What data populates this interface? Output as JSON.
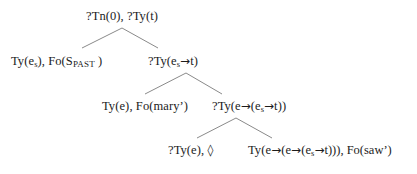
{
  "diagram": {
    "type": "semantic-tree",
    "background_color": "#ffffff",
    "text_color": "#1c1c1c",
    "edge_color": "#8a8a8a",
    "nodes": {
      "root": {
        "label": "?Tn(0), ?Ty(t)",
        "parts": {
          "a": "?Tn(0), ?Ty(",
          "b": "t)"
        }
      },
      "tense": {
        "prefix": "Ty(e",
        "sub1": "s",
        "mid": "), Fo(S",
        "smallcaps": "PAST",
        "suffix": " )"
      },
      "es_to_t": {
        "prefix": "?Ty(e",
        "sub1": "s",
        "arrow": "→",
        "suffix": "t)"
      },
      "mary": {
        "label": "Ty(e), Fo(mary’)"
      },
      "e_to_es_t": {
        "prefix": "?Ty(e",
        "arrow1": "→",
        "mid": "(e",
        "sub1": "s",
        "arrow2": "→",
        "suffix": "t))"
      },
      "pointer": {
        "prefix": "?Ty(e), ",
        "pointer_symbol": "◊"
      },
      "saw": {
        "prefix": "Ty(e",
        "arrow1": "→",
        "mid1": "(e",
        "arrow2": "→",
        "mid2": "(e",
        "sub1": "s",
        "arrow3": "→",
        "suffix": "t))), Fo(saw’)"
      }
    },
    "edges": [
      {
        "from": "root",
        "to": "tense",
        "x1": 122,
        "y1": 28,
        "x2": 82,
        "y2": 48
      },
      {
        "from": "root",
        "to": "es_to_t",
        "x1": 122,
        "y1": 28,
        "x2": 158,
        "y2": 48
      },
      {
        "from": "es_to_t",
        "to": "mary",
        "x1": 186,
        "y1": 73,
        "x2": 145,
        "y2": 94
      },
      {
        "from": "es_to_t",
        "to": "e_to_es_t",
        "x1": 186,
        "y1": 73,
        "x2": 222,
        "y2": 94
      },
      {
        "from": "e_to_es_t",
        "to": "pointer",
        "x1": 236,
        "y1": 118,
        "x2": 197,
        "y2": 138
      },
      {
        "from": "e_to_es_t",
        "to": "saw",
        "x1": 236,
        "y1": 118,
        "x2": 272,
        "y2": 138
      }
    ]
  }
}
